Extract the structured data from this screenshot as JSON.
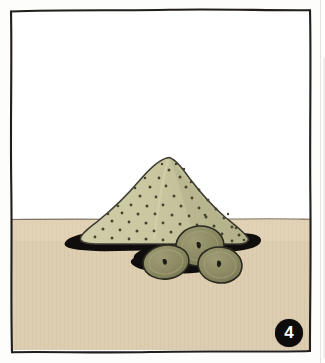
{
  "page": {
    "width": 325,
    "height": 363,
    "kind": "scanned-illustration-panel",
    "paper_color": "#fdfdfb"
  },
  "frame": {
    "name": "hand-drawn-border",
    "stroke_color": "#211e1c",
    "stroke_width": 2.0,
    "style": "wobbly ink rectangle"
  },
  "scene": {
    "title": "Mound of speckled meal with three sliced rounds",
    "sky": {
      "label": "upper background",
      "color": "#ffffff"
    },
    "ground": {
      "label": "table surface",
      "color": "#ddcdb0",
      "texture_color": "#d2c0a1",
      "horizon_y": 219,
      "horizon_line_color": "#6a5f52"
    },
    "mound": {
      "label": "conical mound",
      "fill_color": "#cbc9a2",
      "shade_color": "#b8b68f",
      "outline_color": "#3a3830",
      "speckle_color": "#47432f",
      "speckle_count": 64,
      "peak": {
        "x": 170,
        "y": 158
      },
      "base_left_x": 78,
      "base_right_x": 247,
      "base_y": 239
    },
    "shadow": {
      "label": "cast shadow",
      "color": "#100e0c",
      "left_x": 62,
      "right_x": 262,
      "center_y": 243
    },
    "rounds": [
      {
        "name": "round-slice-left",
        "cx": 166,
        "cy": 262,
        "rx": 23,
        "ry": 17,
        "rotate": -8,
        "fill_color": "#8d8c64",
        "rim_color": "#a3a179",
        "outline_color": "#2b2a21",
        "center_mark_color": "#1d1c16"
      },
      {
        "name": "round-slice-back",
        "cx": 200,
        "cy": 246,
        "rx": 24,
        "ry": 20,
        "rotate": -4,
        "fill_color": "#8a8a62",
        "rim_color": "#9e9c74",
        "outline_color": "#2b2a21",
        "center_mark_color": "#1d1c16"
      },
      {
        "name": "round-slice-right",
        "cx": 220,
        "cy": 265,
        "rx": 22,
        "ry": 18,
        "rotate": 6,
        "fill_color": "#8b8b63",
        "rim_color": "#a09e76",
        "outline_color": "#2b2a21",
        "center_mark_color": "#1d1c16"
      }
    ]
  },
  "badge": {
    "label": "4",
    "name": "step-number-badge",
    "background_color": "#0d0c0b",
    "text_color": "#ffffff"
  },
  "accessibility": {
    "alt_text": "Step 4: a cone-shaped pile of speckled ground meal sits on a tan surface with three olive-green round slices resting in front of it, all casting a dark shadow."
  }
}
